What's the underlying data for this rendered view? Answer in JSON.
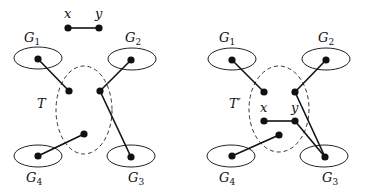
{
  "figure": {
    "left": {
      "tree_label": "T",
      "edge_xy": {
        "x_label": "x",
        "y_label": "y"
      },
      "clusters": [
        {
          "name": "G",
          "sub": "1"
        },
        {
          "name": "G",
          "sub": "2"
        },
        {
          "name": "G",
          "sub": "3"
        },
        {
          "name": "G",
          "sub": "4"
        }
      ]
    },
    "right": {
      "tree_label": "T′",
      "edge_xy": {
        "x_label": "x",
        "y_label": "y"
      },
      "clusters": [
        {
          "name": "G",
          "sub": "1"
        },
        {
          "name": "G",
          "sub": "2"
        },
        {
          "name": "G",
          "sub": "3"
        },
        {
          "name": "G",
          "sub": "4"
        }
      ]
    }
  }
}
